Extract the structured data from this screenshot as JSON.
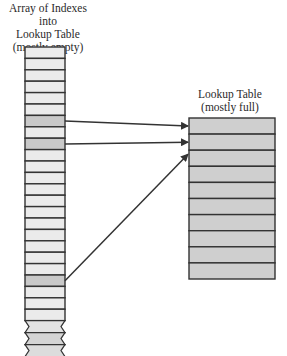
{
  "left_array": {
    "title_lines": [
      "Array of Indexes into",
      "Lookup Table",
      "(mostly empty)"
    ],
    "row_count": 24,
    "shaded_rows": [
      6,
      8,
      20
    ],
    "continues": true,
    "empty_fill": "#ebebeb",
    "shaded_fill": "#c9c9c9"
  },
  "lookup_table": {
    "title_lines": [
      "Lookup Table",
      "(mostly full)"
    ],
    "row_count": 10,
    "fill": "#cfcfcf"
  },
  "arrows": [
    {
      "from_row": 6,
      "to_row": 0
    },
    {
      "from_row": 8,
      "to_row": 1
    },
    {
      "from_row": 20,
      "to_row": 2
    }
  ],
  "colors": {
    "stroke": "#333333",
    "background": "#ffffff"
  }
}
